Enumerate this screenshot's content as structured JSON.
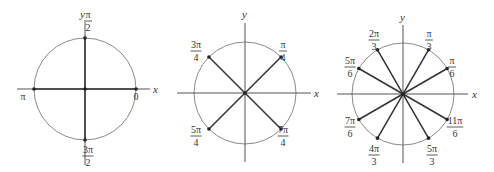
{
  "figure": {
    "axis_labels": {
      "x": "x",
      "y": "y"
    },
    "colors": {
      "circle": "#8a8a8a",
      "axis": "#555555",
      "radius": "#333333",
      "point": "#222222"
    },
    "panels": [
      {
        "id": "quarter",
        "center": [
          85,
          89
        ],
        "radius": 51,
        "x_axis": [
          17,
          150
        ],
        "y_axis": [
          22,
          165
        ],
        "x_label_pos": [
          153,
          93
        ],
        "y_label_pos": [
          80,
          18
        ],
        "draw_diameters": true,
        "angles": [
          {
            "deg": 0,
            "num": "0",
            "den": "",
            "lx": 136,
            "ly": 96
          },
          {
            "deg": 90,
            "num": "π",
            "den": "2",
            "lx": 88,
            "ly": 10
          },
          {
            "deg": 180,
            "num": "π",
            "den": "",
            "lx": 23,
            "ly": 96
          },
          {
            "deg": 270,
            "num": "3π",
            "den": "2",
            "lx": 88,
            "ly": 145
          }
        ]
      },
      {
        "id": "eighth",
        "center": [
          245,
          93
        ],
        "radius": 51,
        "x_axis": [
          177,
          311
        ],
        "y_axis": [
          23,
          162
        ],
        "x_label_pos": [
          314,
          97
        ],
        "y_label_pos": [
          242,
          18
        ],
        "draw_diameters": false,
        "angles": [
          {
            "deg": 45,
            "num": "π",
            "den": "4",
            "lx": 283,
            "ly": 40
          },
          {
            "deg": 135,
            "num": "3π",
            "den": "4",
            "lx": 196,
            "ly": 40
          },
          {
            "deg": 225,
            "num": "5π",
            "den": "4",
            "lx": 196,
            "ly": 125
          },
          {
            "deg": 315,
            "num": "7π",
            "den": "4",
            "lx": 283,
            "ly": 125
          }
        ]
      },
      {
        "id": "sixth",
        "center": [
          403,
          94
        ],
        "radius": 51,
        "x_axis": [
          337,
          468
        ],
        "y_axis": [
          25,
          163
        ],
        "x_label_pos": [
          472,
          98
        ],
        "y_label_pos": [
          400,
          21
        ],
        "draw_diameters": false,
        "angles": [
          {
            "deg": 30,
            "num": "π",
            "den": "6",
            "lx": 452,
            "ly": 56
          },
          {
            "deg": 60,
            "num": "π",
            "den": "3",
            "lx": 429,
            "ly": 29
          },
          {
            "deg": 120,
            "num": "2π",
            "den": "3",
            "lx": 374,
            "ly": 29
          },
          {
            "deg": 150,
            "num": "5π",
            "den": "6",
            "lx": 350,
            "ly": 56
          },
          {
            "deg": 210,
            "num": "7π",
            "den": "6",
            "lx": 350,
            "ly": 116
          },
          {
            "deg": 240,
            "num": "4π",
            "den": "3",
            "lx": 374,
            "ly": 144
          },
          {
            "deg": 300,
            "num": "5π",
            "den": "3",
            "lx": 432,
            "ly": 144
          },
          {
            "deg": 330,
            "num": "11π",
            "den": "6",
            "lx": 455,
            "ly": 116
          }
        ]
      }
    ]
  }
}
